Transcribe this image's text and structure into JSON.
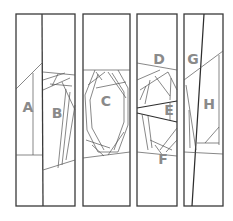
{
  "diagram": {
    "title": "",
    "type": "quilt-pattern-sections",
    "panels": [
      {
        "id": "panel-1",
        "sections": [
          "A",
          "B"
        ]
      },
      {
        "id": "panel-2",
        "sections": [
          "C"
        ]
      },
      {
        "id": "panel-3",
        "sections": [
          "D",
          "E",
          "F"
        ]
      },
      {
        "id": "panel-4",
        "sections": [
          "G",
          "H"
        ]
      }
    ],
    "labels": {
      "a": "A",
      "b": "B",
      "c": "C",
      "d": "D",
      "e": "E",
      "f": "F",
      "g": "G",
      "h": "H"
    },
    "colors": {
      "stroke": "#3a3a3a",
      "label": "#8a8a8a",
      "background": "#ffffff"
    }
  }
}
